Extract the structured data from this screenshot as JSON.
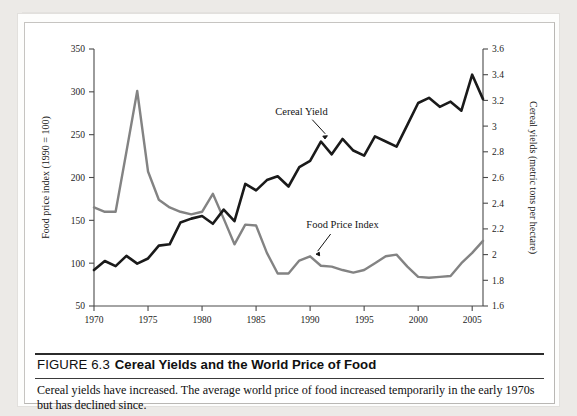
{
  "figure": {
    "number": "FIGURE 6.3",
    "title": "Cereal Yields and the World Price of Food",
    "caption": "Cereal yields have increased. The average world price of food increased temporarily in the early 1970s but has declined since."
  },
  "annotations": {
    "cereal_yield_label": "Cereal Yield",
    "food_price_label": "Food Price Index"
  },
  "colors": {
    "cereal_yield_line": "#1a1a1a",
    "food_price_line": "#838383",
    "axis": "#4a4a4a",
    "text": "#141414",
    "page": "#ffffff"
  },
  "chart_data": {
    "type": "line",
    "title": "Cereal Yields and the World Price of Food",
    "xlabel": "",
    "ylabel": "Food price index (1990 = 100)",
    "y2label": "Cereal yields (metric tons per hectare)",
    "grid": false,
    "legend": "annotated-inline",
    "xlim": [
      1970,
      2006
    ],
    "xticks": [
      1970,
      1975,
      1980,
      1985,
      1990,
      1995,
      2000,
      2005
    ],
    "xtick_labels": [
      "1970",
      "1975",
      "1980",
      "1985",
      "1990",
      "1995",
      "2000",
      "2005"
    ],
    "ylim": [
      50,
      350
    ],
    "yticks": [
      50,
      100,
      150,
      200,
      250,
      300,
      350
    ],
    "ytick_labels": [
      "50",
      "100",
      "150",
      "200",
      "250",
      "300",
      "350"
    ],
    "y2lim": [
      1.6,
      3.6
    ],
    "y2ticks": [
      1.6,
      1.8,
      2.0,
      2.2,
      2.4,
      2.6,
      2.8,
      3.0,
      3.2,
      3.4,
      3.6
    ],
    "y2tick_labels": [
      "1.6",
      "1.8",
      "2",
      "2.2",
      "2.4",
      "2.6",
      "2.8",
      "3",
      "3.2",
      "3.4",
      "3.6"
    ],
    "x": [
      1970,
      1971,
      1972,
      1973,
      1974,
      1975,
      1976,
      1977,
      1978,
      1979,
      1980,
      1981,
      1982,
      1983,
      1984,
      1985,
      1986,
      1987,
      1988,
      1989,
      1990,
      1991,
      1992,
      1993,
      1994,
      1995,
      1996,
      1997,
      1998,
      1999,
      2000,
      2001,
      2002,
      2003,
      2004,
      2005,
      2006
    ],
    "series": [
      {
        "name": "Food Price Index",
        "axis": "left",
        "units": "index (1990 = 100)",
        "color": "#838383",
        "values": [
          165,
          160,
          160,
          230,
          301,
          207,
          174,
          165,
          160,
          157,
          160,
          181,
          152,
          122,
          145,
          144,
          112,
          88,
          88,
          103,
          108,
          97,
          96,
          92,
          89,
          92,
          100,
          108,
          110,
          96,
          84,
          83,
          84,
          85,
          100,
          112,
          126
        ]
      },
      {
        "name": "Cereal Yield",
        "axis": "right",
        "units": "metric tons per hectare",
        "color": "#1a1a1a",
        "values": [
          1.88,
          1.95,
          1.91,
          1.99,
          1.93,
          1.97,
          2.07,
          2.08,
          2.25,
          2.28,
          2.3,
          2.24,
          2.35,
          2.26,
          2.55,
          2.5,
          2.58,
          2.61,
          2.53,
          2.68,
          2.73,
          2.88,
          2.78,
          2.9,
          2.81,
          2.77,
          2.92,
          2.88,
          2.84,
          3.01,
          3.18,
          3.22,
          3.15,
          3.19,
          3.12,
          3.4,
          3.21
        ]
      }
    ],
    "annotations": [
      {
        "text": "Cereal Yield",
        "x": 1990,
        "y2": 3.08
      },
      {
        "text": "Food Price Index",
        "x": 1992.5,
        "y": 140
      }
    ]
  }
}
